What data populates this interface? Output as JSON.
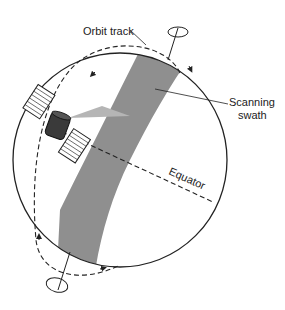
{
  "diagram": {
    "type": "satellite-orbit-illustration",
    "labels": {
      "orbit_track": "Orbit track",
      "scanning_line1": "Scanning",
      "scanning_line2": "swath",
      "equator": "Equator"
    },
    "colors": {
      "background": "#ffffff",
      "outline": "#222222",
      "swath": "#8f8f8f",
      "beam": "#b5b5b5",
      "satellite_body": "#3a3a3a",
      "panel_fill": "#ffffff"
    }
  }
}
